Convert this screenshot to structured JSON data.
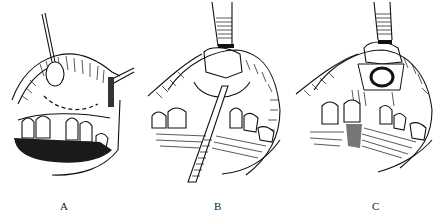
{
  "figure": {
    "panels": [
      {
        "id": "A",
        "label": "A",
        "elements": [
          "retracted-lip",
          "hook-retractor",
          "dashed-incision-line",
          "upper-teeth",
          "lower-lip-shadow"
        ]
      },
      {
        "id": "B",
        "label": "B",
        "elements": [
          "forceps-upper",
          "raised-mucoperiosteal-flap",
          "elevator-instrument",
          "upper-teeth",
          "lower-lip"
        ]
      },
      {
        "id": "C",
        "label": "C",
        "elements": [
          "forceps-upper",
          "raised-flap",
          "bone-window-opening",
          "upper-teeth",
          "lower-lip"
        ]
      }
    ]
  },
  "colors": {
    "ink": "#111111",
    "background": "#ffffff"
  }
}
